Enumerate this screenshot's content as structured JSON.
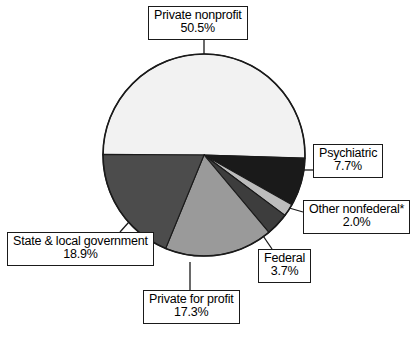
{
  "chart_data": {
    "type": "pie",
    "title": "",
    "subtitle": "",
    "xlabel": "",
    "ylabel": "",
    "legend_position": "callout-labels",
    "grid": false,
    "units": "percent",
    "start_angle_deg": 270,
    "direction": "clockwise",
    "categories": [
      "Private nonprofit",
      "Psychiatric",
      "Other nonfederal*",
      "Federal",
      "Private for profit",
      "State & local government"
    ],
    "values": [
      50.5,
      7.7,
      2.0,
      3.7,
      17.3,
      18.9
    ],
    "value_labels": [
      "50.5%",
      "7.7%",
      "2.0%",
      "3.7%",
      "17.3%",
      "18.9%"
    ],
    "colors": [
      "#f2f2f2",
      "#1a1a1a",
      "#bdbdbd",
      "#3d3d3d",
      "#9a9a9a",
      "#4c4c4c"
    ],
    "slices": [
      {
        "name": "Private nonprofit",
        "value": 50.5,
        "value_label": "50.5%",
        "color": "#f2f2f2",
        "start_deg": 270.0,
        "sweep_deg": 181.8
      },
      {
        "name": "Psychiatric",
        "value": 7.7,
        "value_label": "7.7%",
        "color": "#1a1a1a",
        "start_deg": 91.8,
        "sweep_deg": 27.72
      },
      {
        "name": "Other nonfederal*",
        "value": 2.0,
        "value_label": "2.0%",
        "color": "#bdbdbd",
        "start_deg": 119.52,
        "sweep_deg": 7.2
      },
      {
        "name": "Federal",
        "value": 3.7,
        "value_label": "3.7%",
        "color": "#3d3d3d",
        "start_deg": 126.72,
        "sweep_deg": 13.32
      },
      {
        "name": "Private for profit",
        "value": 17.3,
        "value_label": "17.3%",
        "color": "#9a9a9a",
        "start_deg": 140.04,
        "sweep_deg": 62.28
      },
      {
        "name": "State & local government",
        "value": 18.9,
        "value_label": "18.9%",
        "color": "#4c4c4c",
        "start_deg": 202.32,
        "sweep_deg": 68.04
      }
    ]
  },
  "labels": {
    "private_nonprofit": {
      "name": "Private nonprofit",
      "value": "50.5%"
    },
    "psychiatric": {
      "name": "Psychiatric",
      "value": "7.7%"
    },
    "other_nonfederal": {
      "name": "Other nonfederal*",
      "value": "2.0%"
    },
    "federal": {
      "name": "Federal",
      "value": "3.7%"
    },
    "private_for_profit": {
      "name": "Private for profit",
      "value": "17.3%"
    },
    "state_local": {
      "name": "State & local government",
      "value": "18.9%"
    }
  },
  "style": {
    "outline_color": "#1a1a1a",
    "leader_color": "#1a1a1a",
    "background": "#ffffff"
  }
}
